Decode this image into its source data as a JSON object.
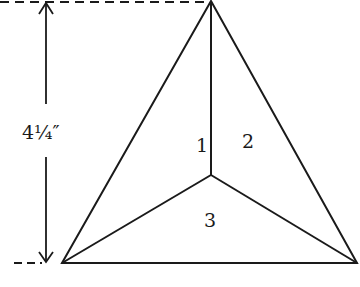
{
  "diagram": {
    "type": "geometric-figure",
    "dimension_label": "4¼″",
    "regions": [
      {
        "id": 1,
        "label": "1"
      },
      {
        "id": 2,
        "label": "2"
      },
      {
        "id": 3,
        "label": "3"
      }
    ],
    "colors": {
      "line": "#1a1a1a",
      "background": "#ffffff"
    }
  }
}
